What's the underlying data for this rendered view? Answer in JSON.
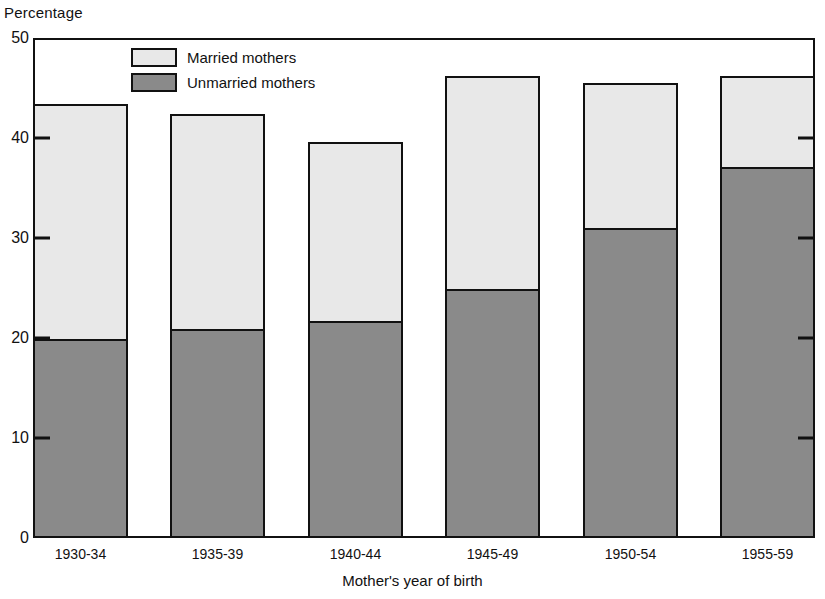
{
  "chart_data": {
    "type": "bar",
    "subtype": "stacked-vertical",
    "title": "",
    "ylabel": "Percentage",
    "xlabel": "Mother's year of birth",
    "categories": [
      "1930-34",
      "1935-39",
      "1940-44",
      "1945-49",
      "1950-54",
      "1955-59"
    ],
    "series": [
      {
        "name": "Unmarried mothers",
        "color": "#8a8a8a",
        "values": [
          20.1,
          21.1,
          21.9,
          25.1,
          31.2,
          37.3
        ]
      },
      {
        "name": "Married mothers",
        "color": "#e8e8e8",
        "values": [
          23.3,
          21.3,
          17.7,
          21.1,
          14.3,
          8.9
        ]
      }
    ],
    "totals": [
      43.4,
      42.4,
      39.6,
      46.2,
      45.5,
      46.2
    ],
    "ylim": [
      0,
      50
    ],
    "yticks": [
      0,
      10,
      20,
      30,
      40,
      50
    ],
    "ytick_labels": [
      "0",
      "10",
      "20",
      "30",
      "40",
      "50"
    ],
    "grid": false,
    "legend_position": "top-center-left",
    "legend_entries": [
      "Married mothers",
      "Unmarried mothers"
    ]
  },
  "legend": {
    "married_label": "Married mothers",
    "unmarried_label": "Unmarried mothers"
  },
  "axes": {
    "y_axis_title": "Percentage",
    "x_axis_title": "Mother's year of birth"
  }
}
